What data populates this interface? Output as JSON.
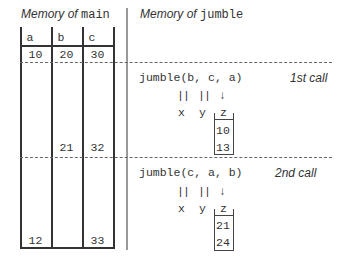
{
  "left_panel": {
    "title_prefix": "Memory of ",
    "title_code": "main",
    "columns": [
      "a",
      "b",
      "c"
    ],
    "initial_values": [
      "10",
      "20",
      "30"
    ],
    "after_first_call": [
      "",
      "21",
      "32"
    ],
    "after_second_call": [
      "12",
      "",
      "33"
    ]
  },
  "right_panel": {
    "title_prefix": "Memory of ",
    "title_code": "jumble",
    "calls": [
      {
        "call_text": "jumble(b, c, a)",
        "label": "1st call",
        "ref_marks": [
          "||",
          "||"
        ],
        "value_arrow": "↓",
        "params": [
          "x",
          "y",
          "z"
        ],
        "z_values": [
          "10",
          "13"
        ]
      },
      {
        "call_text": "jumble(c, a, b)",
        "label": "2nd call",
        "ref_marks": [
          "||",
          "||"
        ],
        "value_arrow": "↓",
        "params": [
          "x",
          "y",
          "z"
        ],
        "z_values": [
          "21",
          "24"
        ]
      }
    ]
  },
  "colors": {
    "ink": "#333333",
    "separator": "#999999",
    "dashed": "#666666"
  }
}
